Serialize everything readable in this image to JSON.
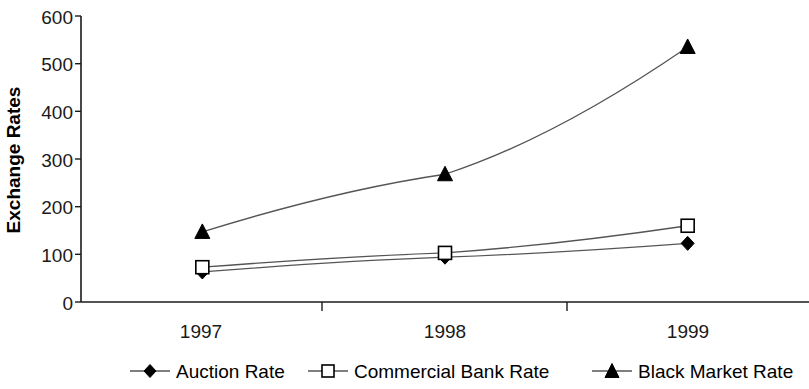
{
  "chart_data": {
    "type": "line",
    "title": "",
    "xlabel": "",
    "ylabel": "Exchange Rates",
    "categories": [
      "1997",
      "1998",
      "1999"
    ],
    "ylim": [
      0,
      600
    ],
    "y_ticks": [
      0,
      100,
      200,
      300,
      400,
      500,
      600
    ],
    "y_tick_labels": [
      "0",
      "100",
      "200",
      "300",
      "400",
      "500",
      "600"
    ],
    "grid": false,
    "legend_position": "bottom",
    "series": [
      {
        "name": "Auction Rate",
        "marker": "filled-diamond",
        "values": [
          63,
          94,
          123
        ]
      },
      {
        "name": "Commercial Bank Rate",
        "marker": "open-square",
        "values": [
          73,
          103,
          160
        ]
      },
      {
        "name": "Black Market Rate",
        "marker": "filled-triangle",
        "values": [
          147,
          268,
          535
        ]
      }
    ]
  },
  "legend": {
    "items": [
      {
        "label": "Auction Rate",
        "marker": "filled-diamond"
      },
      {
        "label": "Commercial Bank Rate",
        "marker": "open-square"
      },
      {
        "label": "Black Market Rate",
        "marker": "filled-triangle"
      }
    ]
  },
  "axes": {
    "y_title": "Exchange Rates",
    "y_labels": [
      "600",
      "500",
      "400",
      "300",
      "200",
      "100",
      "0"
    ],
    "x_labels": [
      "1997",
      "1998",
      "1999"
    ]
  },
  "colors": {
    "line": "#555555",
    "marker_fill": "#000000",
    "marker_open_fill": "#ffffff",
    "axis": "#1a1a1a",
    "text": "#000000",
    "background": "#ffffff"
  }
}
